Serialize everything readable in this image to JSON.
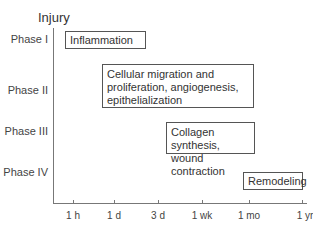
{
  "title": "Injury",
  "y_axis": {
    "labels": [
      "Phase I",
      "Phase II",
      "Phase III",
      "Phase IV"
    ]
  },
  "x_axis": {
    "ticks": [
      "1 h",
      "1 d",
      "3 d",
      "1 wk",
      "1 mo",
      "1 yr"
    ]
  },
  "phases": [
    {
      "phase": "Phase I",
      "label": "Inflammation"
    },
    {
      "phase": "Phase II",
      "label_lines": [
        "Cellular migration and",
        "proliferation, angiogenesis,",
        "epithelialization"
      ]
    },
    {
      "phase": "Phase III",
      "label_lines": [
        "Collagen synthesis,",
        "wound contraction"
      ]
    },
    {
      "phase": "Phase IV",
      "label": "Remodeling"
    }
  ],
  "colors": {
    "axis": "#777777",
    "text": "#333333",
    "box_border": "#555555"
  }
}
